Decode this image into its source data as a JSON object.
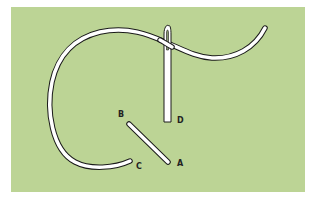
{
  "diagram": {
    "title": "",
    "colors": {
      "panel": "#bcd495",
      "thread_fill": "#ffffff",
      "thread_outline": "#1a1a1a"
    },
    "labels": {
      "A": "A",
      "B": "B",
      "C": "C",
      "D": "D"
    },
    "elements": [
      {
        "name": "thread",
        "description": "long curved thread looping from C up and over through needle eye"
      },
      {
        "name": "needle",
        "description": "vertical needle ending at point D"
      },
      {
        "name": "stitch",
        "description": "short diagonal stitch from B to A"
      }
    ]
  }
}
